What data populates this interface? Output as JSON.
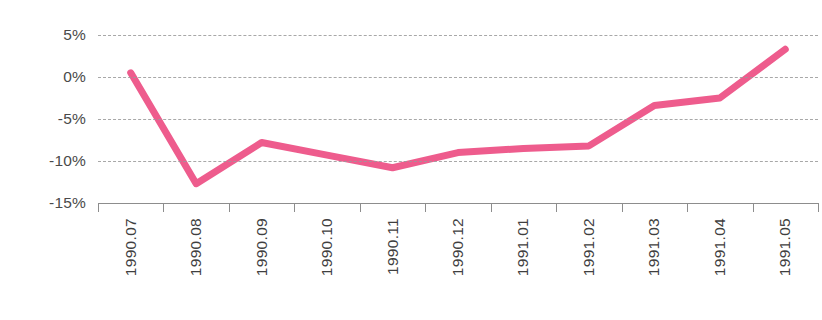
{
  "chart_data": {
    "type": "line",
    "title": "",
    "xlabel": "",
    "ylabel": "",
    "categories": [
      "1990.07",
      "1990.08",
      "1990.09",
      "1990.10",
      "1990.11",
      "1990.12",
      "1991.01",
      "1991.02",
      "1991.03",
      "1991.04",
      "1991.05"
    ],
    "values": [
      0.5,
      -12.7,
      -7.8,
      -9.3,
      -10.8,
      -9.0,
      -8.5,
      -8.2,
      -3.4,
      -2.5,
      3.3
    ],
    "series": [
      {
        "name": "",
        "values": [
          0.5,
          -12.7,
          -7.8,
          -9.3,
          -10.8,
          -9.0,
          -8.5,
          -8.2,
          -3.4,
          -2.5,
          3.3
        ]
      }
    ],
    "ylim": [
      -15,
      5
    ],
    "yticks": [
      5,
      0,
      -5,
      -10,
      -15
    ],
    "ytick_labels": [
      "5%",
      "0%",
      "-5%",
      "-10%",
      "-15%"
    ],
    "grid": true,
    "legend": false,
    "legend_position": "none",
    "line_color": "#ee5c8d",
    "line_width": 7,
    "gridline_color": "#9a9a9a",
    "axis_color": "#8d8d8d",
    "label_color": "#3f3f3f",
    "background": "#ffffff"
  }
}
